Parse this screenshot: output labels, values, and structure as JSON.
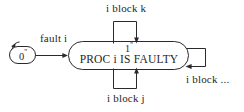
{
  "diagram": {
    "type": "finite-state-machine",
    "title": "",
    "background_color": "#ffffff",
    "stroke_color": "#2a2a2a",
    "text_color": "#1f1f1f",
    "states": [
      {
        "id": "state-0",
        "state_number": "0",
        "prime": "''",
        "label": "0''",
        "shape": "rounded-rectangle",
        "is_initial": true,
        "body_text": ""
      },
      {
        "id": "state-1",
        "state_number": "1",
        "prime": "''",
        "label": "1''",
        "shape": "rounded-rectangle",
        "is_initial": false,
        "body_text": "PROC i IS FAULTY"
      }
    ],
    "transitions": [
      {
        "id": "t-fault-i",
        "label": "fault i",
        "from": "state-0",
        "to": "state-1",
        "kind": "straight",
        "direction": "left-to-right"
      },
      {
        "id": "t-i-block-k",
        "label": "i block k",
        "from": "state-1",
        "to": "state-1",
        "kind": "self-loop",
        "direction": "top"
      },
      {
        "id": "t-i-block-j",
        "label": "i block j",
        "from": "state-1",
        "to": "state-1",
        "kind": "self-loop",
        "direction": "bottom"
      },
      {
        "id": "t-i-block-dots",
        "label": "i block ...",
        "from": "state-1",
        "to": "state-1",
        "kind": "self-loop",
        "direction": "right"
      }
    ],
    "initial_marker": {
      "id": "initial-arrow",
      "target": "state-0",
      "label": ""
    }
  }
}
